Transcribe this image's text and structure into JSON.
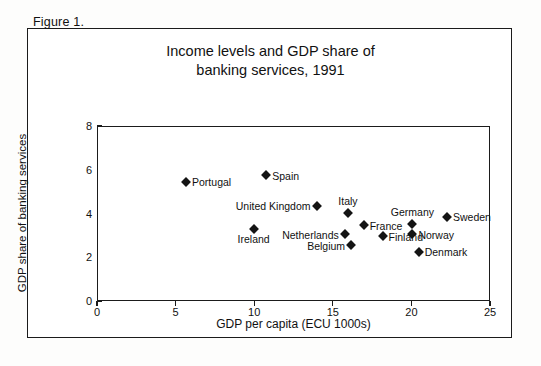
{
  "figure": {
    "caption": "Figure 1."
  },
  "chart_data": {
    "type": "scatter",
    "title_line1": "Income levels and GDP share of",
    "title_line2": "banking services, 1991",
    "title": "Income levels and GDP share of banking services, 1991",
    "xlabel": "GDP per capita (ECU 1000s)",
    "ylabel": "GDP share of banking services",
    "xlim": [
      0,
      25
    ],
    "ylim": [
      0,
      8
    ],
    "xticks": [
      "0",
      "5",
      "10",
      "15",
      "20",
      "25"
    ],
    "yticks": [
      "0",
      "2",
      "4",
      "6",
      "8"
    ],
    "grid": false,
    "legend": "none",
    "points": [
      {
        "label": "Portugal",
        "x": 5.6,
        "y": 5.5,
        "label_pos": "right"
      },
      {
        "label": "Spain",
        "x": 10.7,
        "y": 5.8,
        "label_pos": "right"
      },
      {
        "label": "United Kingdom",
        "x": 13.9,
        "y": 4.4,
        "label_pos": "left"
      },
      {
        "label": "Italy",
        "x": 15.9,
        "y": 4.05,
        "label_pos": "above"
      },
      {
        "label": "France",
        "x": 16.9,
        "y": 3.5,
        "label_pos": "right"
      },
      {
        "label": "Germany",
        "x": 20.0,
        "y": 3.55,
        "label_pos": "above"
      },
      {
        "label": "Sweden",
        "x": 22.2,
        "y": 3.9,
        "label_pos": "right"
      },
      {
        "label": "Norway",
        "x": 20.0,
        "y": 3.1,
        "label_pos": "right"
      },
      {
        "label": "Denmark",
        "x": 20.4,
        "y": 2.3,
        "label_pos": "right"
      },
      {
        "label": "Netherlands",
        "x": 15.7,
        "y": 3.1,
        "label_pos": "left"
      },
      {
        "label": "Belgium",
        "x": 16.1,
        "y": 2.6,
        "label_pos": "left"
      },
      {
        "label": "Finland",
        "x": 18.1,
        "y": 3.0,
        "label_pos": "right"
      },
      {
        "label": "Ireland",
        "x": 9.9,
        "y": 3.35,
        "label_pos": "below"
      }
    ]
  }
}
